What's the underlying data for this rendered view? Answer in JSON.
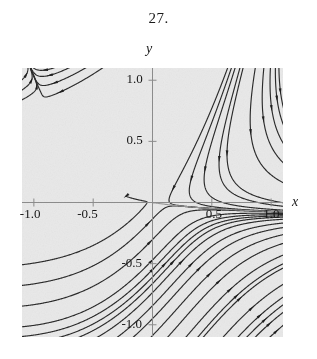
{
  "figure": {
    "problem_number": "27.",
    "background_color": "#ffffff",
    "plot_background_color": "#e9e9e9",
    "stream_color": "#2b2b2b",
    "axis_color": "#8d8d8d"
  },
  "axes": {
    "xlabel": "x",
    "ylabel": "y",
    "x_ticks": [
      {
        "value": -1.0,
        "label": "-1.0"
      },
      {
        "value": -0.5,
        "label": "-0.5"
      },
      {
        "value": 0.5,
        "label": "0.5"
      },
      {
        "value": 1.0,
        "label": "1.0"
      }
    ],
    "y_ticks": [
      {
        "value": 1.0,
        "label": "1.0"
      },
      {
        "value": 0.5,
        "label": "0.5"
      },
      {
        "value": -0.5,
        "label": "-0.5"
      },
      {
        "value": -1.0,
        "label": "-1.0"
      }
    ]
  },
  "chart_data": {
    "type": "scatter",
    "plot_kind": "phase-portrait-streamplot",
    "title": "27.",
    "xlabel": "x",
    "ylabel": "y",
    "xlim": [
      -1.1,
      1.1
    ],
    "ylim": [
      -1.1,
      1.1
    ],
    "grid": false,
    "legend": null,
    "equilibrium_points": [
      {
        "x": 0.0,
        "y": 0.0,
        "type": "saddle"
      }
    ],
    "vector_field": {
      "description": "Nonlinear planar autonomous system; trajectories flow into the origin along a nearly horizontal incoming direction from the left and leave along a down-right separatrix.",
      "dx": "x*x - y",
      "dy": "-0.18*x - 1.0*y - 0.9*x*y"
    },
    "arrow_markers_per_line": 1,
    "seed_counts": {
      "left_edge": 13,
      "right_edge": 13,
      "top_edge": 15,
      "bottom_edge": 15
    },
    "separatrix": {
      "color": "#9a9a9a",
      "note": "faint gray curve exits lower-right beyond the plot frame"
    }
  }
}
